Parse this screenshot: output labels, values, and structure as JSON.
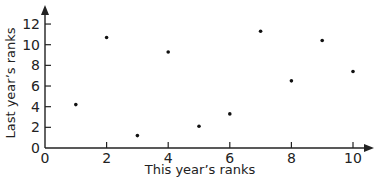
{
  "chart_data": {
    "type": "scatter",
    "title": "",
    "xlabel": "This year’s ranks",
    "ylabel": "Last year’s ranks",
    "xlim": [
      0,
      10.5
    ],
    "ylim": [
      0,
      12.5
    ],
    "x_ticks": [
      0,
      2,
      4,
      6,
      8,
      10
    ],
    "y_ticks": [
      0,
      2,
      4,
      6,
      8,
      10,
      12
    ],
    "grid": false,
    "legend": null,
    "points": [
      {
        "x": 1,
        "y": 4.2
      },
      {
        "x": 2,
        "y": 10.7
      },
      {
        "x": 3,
        "y": 1.2
      },
      {
        "x": 4,
        "y": 9.3
      },
      {
        "x": 5,
        "y": 2.1
      },
      {
        "x": 6,
        "y": 3.3
      },
      {
        "x": 7,
        "y": 11.3
      },
      {
        "x": 8,
        "y": 6.5
      },
      {
        "x": 9,
        "y": 10.4
      },
      {
        "x": 10,
        "y": 7.4
      }
    ]
  },
  "colors": {
    "axis": "#222222",
    "point": "#111111",
    "background": "#ffffff"
  }
}
